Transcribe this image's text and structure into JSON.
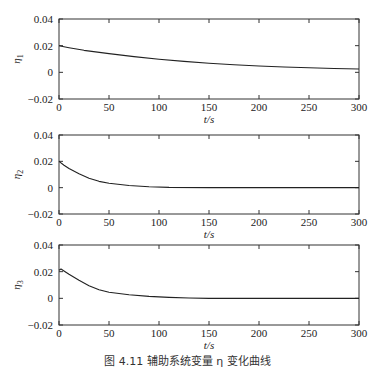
{
  "caption": "图 4.11  辅助系统变量 η 变化曲线",
  "chart_data": [
    {
      "type": "line",
      "title": "",
      "xlabel": "t/s",
      "ylabel": "η1",
      "xlim": [
        0,
        300
      ],
      "ylim": [
        -0.02,
        0.04
      ],
      "xticks": [
        0,
        50,
        100,
        150,
        200,
        250,
        300
      ],
      "yticks": [
        -0.02,
        0,
        0.02,
        0.04
      ],
      "xtick_labels": [
        "0",
        "50",
        "100",
        "150",
        "200",
        "250",
        "300"
      ],
      "ytick_labels": [
        "−0.02",
        "0",
        "0.02",
        "0.04"
      ],
      "grid": false,
      "series": [
        {
          "name": "η1",
          "x": [
            0,
            10,
            25,
            50,
            75,
            100,
            125,
            150,
            175,
            200,
            225,
            250,
            275,
            300
          ],
          "y": [
            0.02,
            0.0185,
            0.0165,
            0.014,
            0.0118,
            0.0098,
            0.0082,
            0.0068,
            0.0057,
            0.0047,
            0.004,
            0.0034,
            0.0029,
            0.0025
          ]
        }
      ]
    },
    {
      "type": "line",
      "title": "",
      "xlabel": "t/s",
      "ylabel": "η2",
      "xlim": [
        0,
        300
      ],
      "ylim": [
        -0.02,
        0.04
      ],
      "xticks": [
        0,
        50,
        100,
        150,
        200,
        250,
        300
      ],
      "yticks": [
        -0.02,
        0,
        0.02,
        0.04
      ],
      "xtick_labels": [
        "0",
        "50",
        "100",
        "150",
        "200",
        "250",
        "300"
      ],
      "ytick_labels": [
        "−0.02",
        "0",
        "0.02",
        "0.04"
      ],
      "grid": false,
      "series": [
        {
          "name": "η2",
          "x": [
            0,
            5,
            10,
            20,
            30,
            40,
            50,
            70,
            90,
            110,
            150,
            200,
            250,
            300
          ],
          "y": [
            0.02,
            0.017,
            0.0145,
            0.0105,
            0.0072,
            0.0048,
            0.0034,
            0.0016,
            0.0007,
            0.0002,
            0.0,
            0.0,
            0.0,
            0.0
          ]
        }
      ]
    },
    {
      "type": "line",
      "title": "",
      "xlabel": "t/s",
      "ylabel": "η3",
      "xlim": [
        0,
        300
      ],
      "ylim": [
        -0.02,
        0.04
      ],
      "xticks": [
        0,
        50,
        100,
        150,
        200,
        250,
        300
      ],
      "yticks": [
        -0.02,
        0,
        0.02,
        0.04
      ],
      "xtick_labels": [
        "0",
        "50",
        "100",
        "150",
        "200",
        "250",
        "300"
      ],
      "ytick_labels": [
        "−0.02",
        "0",
        "0.02",
        "0.04"
      ],
      "grid": false,
      "series": [
        {
          "name": "η3",
          "x": [
            0,
            2,
            5,
            10,
            20,
            30,
            40,
            50,
            70,
            90,
            110,
            130,
            150,
            200,
            250,
            300
          ],
          "y": [
            0.021,
            0.022,
            0.0205,
            0.018,
            0.0135,
            0.0095,
            0.0065,
            0.0046,
            0.0027,
            0.0015,
            0.0007,
            0.0002,
            0.0,
            0.0,
            0.0,
            0.0
          ]
        }
      ]
    }
  ],
  "panels": [
    {
      "ylabel_main": "η",
      "ylabel_sub": "1",
      "xlabel": "t/s"
    },
    {
      "ylabel_main": "η",
      "ylabel_sub": "2",
      "xlabel": "t/s"
    },
    {
      "ylabel_main": "η",
      "ylabel_sub": "3",
      "xlabel": "t/s"
    }
  ]
}
